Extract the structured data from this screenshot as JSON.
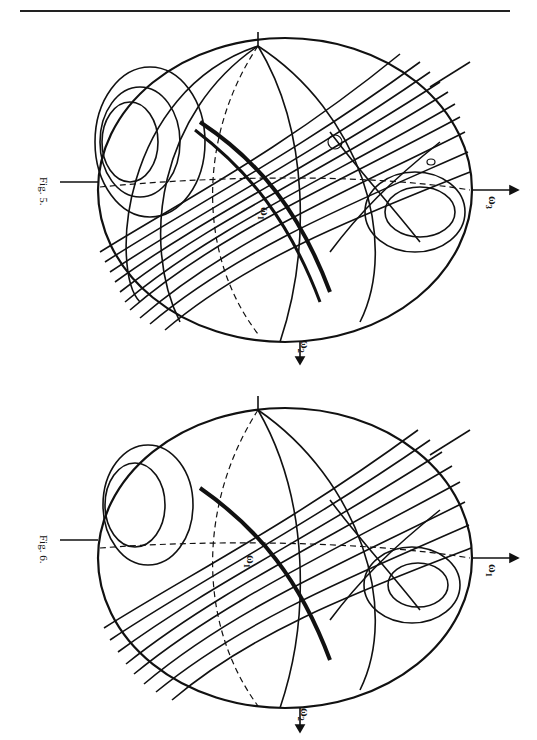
{
  "page": {
    "orientation": "rotated-90",
    "rule": true
  },
  "figures": [
    {
      "id": "fig5",
      "caption": "Fig. 5.",
      "axes": {
        "omega1": "ω",
        "omega1_sub": "1",
        "omega2": "ω",
        "omega2_sub": "2",
        "omega3": "ω",
        "omega3_sub": "3"
      },
      "markers": {
        "circled_point": "⁺⁺",
        "zero_label": "0"
      }
    },
    {
      "id": "fig6",
      "caption": "Fig. 6.",
      "axes": {
        "omega1": "ω",
        "omega1_sub": "1",
        "omega2": "ω",
        "omega2_sub": "2",
        "omega4": "ω",
        "omega4_sub": "1"
      }
    }
  ]
}
